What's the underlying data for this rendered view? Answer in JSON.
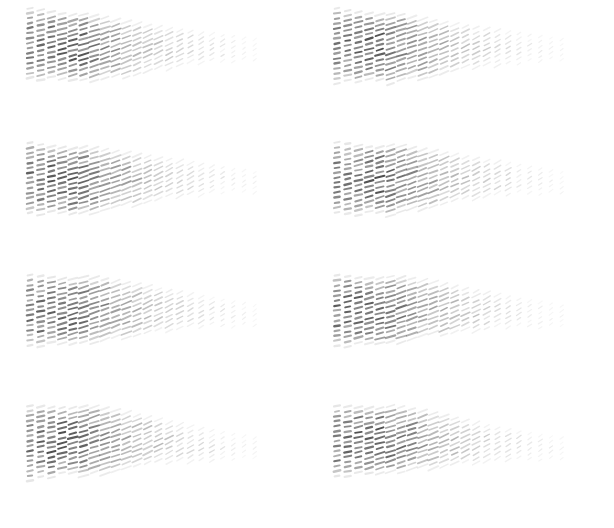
{
  "figure": {
    "title": "",
    "background_color": "#ffffff",
    "width": 614,
    "height": 528,
    "panel_rows": 4,
    "panel_cols": 2,
    "panel_width": 307,
    "panel_height": 132
  },
  "chart_data": {
    "type": "scatter",
    "title": "",
    "subtitle": "",
    "xlabel": "",
    "ylabel": "",
    "grid": false,
    "legend": null,
    "axes_visible": false,
    "tick_labels_x": [],
    "tick_labels_y": [],
    "glyph": {
      "style": "dash-segment",
      "description": "Short tilted line segments (vector/hedgehog glyphs) arranged on a sheared grid forming a tapering cone envelope",
      "tilt_deg_min": -38,
      "tilt_deg_max": -10,
      "length_px_min": 3.0,
      "length_px_max": 9.5,
      "thickness_px_min": 1.1,
      "thickness_px_max": 2.3,
      "color_dark": "#4a4a4a",
      "color_mid": "#8c8c8c",
      "color_light": "#cfcfcf",
      "opacity_min": 0.12,
      "opacity_max": 0.92
    },
    "envelope": {
      "x_start_px": 30,
      "x_end_px": 255,
      "height_left_px": 76,
      "height_right_px": 24,
      "top_slope": 0.115,
      "bottom_slope": -0.23,
      "n_columns": 22,
      "column_spacing_px": 10.7,
      "row_spacing_px": 5.0
    },
    "panels": [
      {
        "index": 0,
        "row": 0,
        "col": 0,
        "seed": 11,
        "origin_x": 30,
        "origin_y": 46,
        "phase": 0.0,
        "amp": 1.0
      },
      {
        "index": 1,
        "row": 0,
        "col": 1,
        "seed": 23,
        "origin_x": 375,
        "origin_y": 46,
        "phase": 0.35,
        "amp": 1.02
      },
      {
        "index": 2,
        "row": 1,
        "col": 0,
        "seed": 37,
        "origin_x": 30,
        "origin_y": 182,
        "phase": 0.7,
        "amp": 0.98
      },
      {
        "index": 3,
        "row": 1,
        "col": 1,
        "seed": 49,
        "origin_x": 375,
        "origin_y": 182,
        "phase": 1.05,
        "amp": 1.01
      },
      {
        "index": 4,
        "row": 2,
        "col": 0,
        "seed": 61,
        "origin_x": 30,
        "origin_y": 318,
        "phase": 1.4,
        "amp": 1.0
      },
      {
        "index": 5,
        "row": 2,
        "col": 1,
        "seed": 73,
        "origin_x": 375,
        "origin_y": 318,
        "phase": 1.75,
        "amp": 0.99
      },
      {
        "index": 6,
        "row": 3,
        "col": 0,
        "seed": 89,
        "origin_x": 30,
        "origin_y": 454,
        "phase": 2.1,
        "amp": 1.03
      },
      {
        "index": 7,
        "row": 3,
        "col": 1,
        "seed": 97,
        "origin_x": 375,
        "origin_y": 454,
        "phase": 2.45,
        "amp": 1.0
      }
    ],
    "column_intensity_profile": [
      0.62,
      0.7,
      0.78,
      0.86,
      0.92,
      0.88,
      0.8,
      0.74,
      0.7,
      0.66,
      0.62,
      0.58,
      0.55,
      0.52,
      0.49,
      0.46,
      0.43,
      0.4,
      0.37,
      0.34,
      0.3,
      0.26
    ],
    "column_height_profile": [
      76,
      74,
      72,
      70,
      69,
      72,
      70,
      66,
      62,
      58,
      54,
      50,
      46,
      43,
      40,
      37,
      34,
      32,
      30,
      28,
      26,
      24
    ]
  }
}
